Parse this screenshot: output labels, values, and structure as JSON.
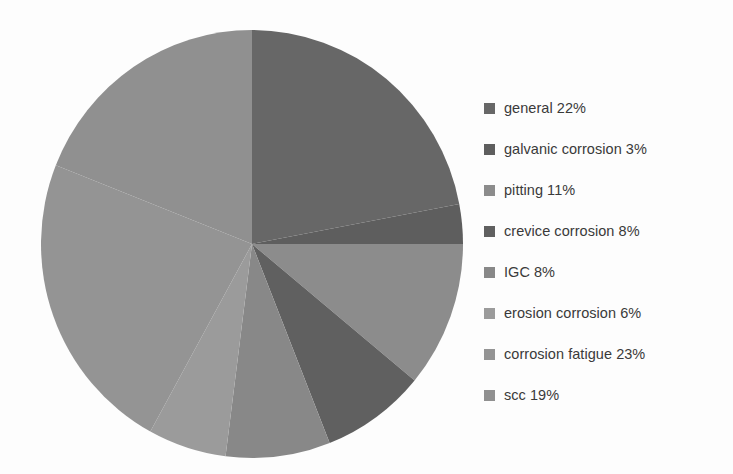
{
  "chart_data": {
    "type": "pie",
    "title": "",
    "subtitle": "",
    "xlabel": "",
    "ylabel": "",
    "grid": false,
    "legend_position": "right",
    "start_angle_deg": 0,
    "direction": "clockwise",
    "units": "percent",
    "total": 100,
    "categories": [
      "general",
      "galvanic corrosion",
      "pitting",
      "crevice corrosion",
      "IGC",
      "erosion corrosion",
      "corrosion fatigue",
      "scc"
    ],
    "values": [
      22,
      3,
      11,
      8,
      8,
      6,
      23,
      19
    ],
    "colors": [
      "#676767",
      "#5e5e5e",
      "#8c8c8c",
      "#606060",
      "#888888",
      "#9b9b9b",
      "#949494",
      "#909090"
    ],
    "slices": [
      {
        "label": "general",
        "value": 22,
        "display": "general 22%",
        "color": "#676767"
      },
      {
        "label": "galvanic corrosion",
        "value": 3,
        "display": "galvanic corrosion 3%",
        "color": "#5e5e5e"
      },
      {
        "label": "pitting",
        "value": 11,
        "display": "pitting 11%",
        "color": "#8c8c8c"
      },
      {
        "label": "crevice corrosion",
        "value": 8,
        "display": "crevice corrosion 8%",
        "color": "#606060"
      },
      {
        "label": "IGC",
        "value": 8,
        "display": "IGC 8%",
        "color": "#888888"
      },
      {
        "label": "erosion corrosion",
        "value": 6,
        "display": "erosion corrosion 6%",
        "color": "#9b9b9b"
      },
      {
        "label": "corrosion fatigue",
        "value": 23,
        "display": "corrosion fatigue 23%",
        "color": "#949494"
      },
      {
        "label": "scc",
        "value": 19,
        "display": "scc 19%",
        "color": "#909090"
      }
    ]
  },
  "legend": {
    "items": [
      {
        "text": "general 22%",
        "color": "#676767"
      },
      {
        "text": "galvanic corrosion 3%",
        "color": "#5e5e5e"
      },
      {
        "text": "pitting 11%",
        "color": "#8c8c8c"
      },
      {
        "text": "crevice corrosion 8%",
        "color": "#606060"
      },
      {
        "text": "IGC 8%",
        "color": "#888888"
      },
      {
        "text": "erosion corrosion 6%",
        "color": "#9b9b9b"
      },
      {
        "text": "corrosion fatigue 23%",
        "color": "#949494"
      },
      {
        "text": "scc 19%",
        "color": "#909090"
      }
    ]
  },
  "geometry": {
    "cx": 252,
    "cy": 244,
    "rx": 211,
    "ry": 214
  }
}
